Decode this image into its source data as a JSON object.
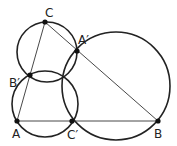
{
  "diagram": {
    "type": "geometry",
    "points": {
      "A": {
        "label": "A",
        "x": 17,
        "y": 121
      },
      "B": {
        "label": "B",
        "x": 158,
        "y": 121
      },
      "C": {
        "label": "C",
        "x": 45,
        "y": 22
      },
      "A_prime": {
        "label": "A′",
        "x": 77,
        "y": 51
      },
      "B_prime": {
        "label": "B′",
        "x": 30,
        "y": 75
      },
      "C_prime": {
        "label": "C′",
        "x": 72,
        "y": 121
      }
    },
    "segments": [
      {
        "from": "A",
        "to": "C"
      },
      {
        "from": "C",
        "to": "B"
      },
      {
        "from": "A",
        "to": "B"
      }
    ],
    "circles": [
      {
        "name": "circle-CA'B'",
        "cx": 47,
        "cy": 52,
        "r": 30
      },
      {
        "name": "circle-AB'C'",
        "cx": 45,
        "cy": 104,
        "r": 33
      },
      {
        "name": "circle-BA'C'",
        "cx": 116,
        "cy": 86,
        "r": 54
      }
    ],
    "colors": {
      "stroke": "#222222",
      "point": "#111111"
    }
  }
}
